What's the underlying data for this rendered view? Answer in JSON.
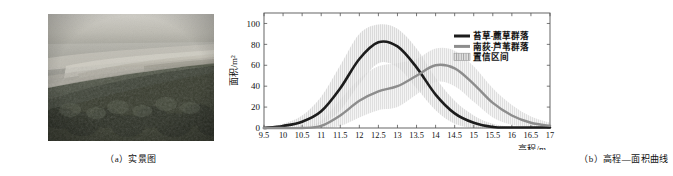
{
  "figure": {
    "panel_a": {
      "caption": "（a）实景图",
      "image_description": "滩涂湿地植被实景照片"
    },
    "panel_b": {
      "caption": "（b）高程—面积曲线"
    }
  },
  "chart_data": {
    "type": "line",
    "title": "",
    "xlabel": "高程/m",
    "ylabel": "面积/m²",
    "xlim": [
      9.5,
      17
    ],
    "ylim": [
      0,
      110
    ],
    "xticks": [
      "9.5",
      "10",
      "10.5",
      "11",
      "11.5",
      "12",
      "12.5",
      "13",
      "13.5",
      "14",
      "14.5",
      "15",
      "15.5",
      "16",
      "16.5",
      "17"
    ],
    "xtick_values": [
      9.5,
      10,
      10.5,
      11,
      11.5,
      12,
      12.5,
      13,
      13.5,
      14,
      14.5,
      15,
      15.5,
      16,
      16.5,
      17
    ],
    "yticks": [
      "0",
      "20",
      "40",
      "60",
      "80",
      "100"
    ],
    "ytick_values": [
      0,
      20,
      40,
      60,
      80,
      100
    ],
    "grid": false,
    "legend_position": "upper right",
    "legend": [
      {
        "label": "苔草-藨草群落",
        "type": "line",
        "color": "#1c1c1c",
        "width": 3
      },
      {
        "label": "南荻-芦苇群落",
        "type": "line",
        "color": "#8d8d8d",
        "width": 3
      },
      {
        "label": "置信区间",
        "type": "band",
        "color": "#c9c9c9"
      }
    ],
    "x": [
      9.5,
      10,
      10.5,
      11,
      11.5,
      12,
      12.5,
      13,
      13.5,
      14,
      14.5,
      15,
      15.5,
      16,
      16.5,
      17
    ],
    "series": [
      {
        "name": "苔草-藨草群落",
        "color": "#1c1c1c",
        "values": [
          0,
          2,
          6,
          16,
          38,
          66,
          82,
          78,
          58,
          32,
          14,
          5,
          1,
          0.5,
          0.5,
          0.5
        ],
        "ci_upper": [
          0,
          4,
          12,
          30,
          60,
          90,
          99,
          95,
          76,
          48,
          26,
          12,
          4,
          1,
          1,
          1
        ],
        "ci_lower": [
          0,
          0,
          1,
          4,
          17,
          42,
          62,
          58,
          38,
          17,
          4,
          0,
          0,
          0,
          0,
          0
        ]
      },
      {
        "name": "南荻-芦苇群落",
        "color": "#8d8d8d",
        "values": [
          0,
          0,
          0,
          2,
          12,
          26,
          35,
          40,
          50,
          60,
          57,
          42,
          24,
          12,
          5,
          2
        ],
        "ci_upper": [
          0,
          0,
          1,
          7,
          27,
          47,
          59,
          62,
          66,
          76,
          74,
          59,
          38,
          22,
          11,
          5
        ],
        "ci_lower": [
          0,
          0,
          0,
          0,
          2,
          10,
          17,
          20,
          32,
          44,
          40,
          25,
          10,
          3,
          1,
          0
        ]
      }
    ]
  }
}
